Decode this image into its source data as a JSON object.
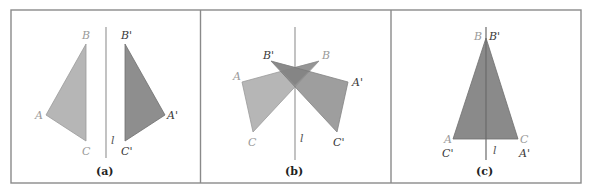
{
  "figure": {
    "colors": {
      "frame": "#8a8a8a",
      "line": "#9a9a9a",
      "original_fill": "#b6b6b6",
      "reflected_fill": "#8e8e8e",
      "original_label": "#9a9a9a",
      "reflected_label": "#3a3a3a"
    },
    "panels": [
      {
        "caption": "(a)",
        "line_label": "l",
        "original": {
          "A": "A",
          "B": "B",
          "C": "C"
        },
        "reflected": {
          "A": "A'",
          "B": "B'",
          "C": "C'"
        }
      },
      {
        "caption": "(b)",
        "line_label": "l",
        "original": {
          "A": "A",
          "B": "B",
          "C": "C"
        },
        "reflected": {
          "A": "A'",
          "B": "B'",
          "C": "C'"
        }
      },
      {
        "caption": "(c)",
        "line_label": "l",
        "original": {
          "A": "A",
          "B": "B",
          "C": "C"
        },
        "reflected": {
          "A": "A'",
          "B": "B'",
          "C": "C'"
        }
      }
    ]
  }
}
